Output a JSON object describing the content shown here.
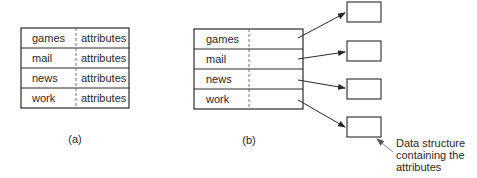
{
  "figure_a": {
    "label": "(a)",
    "rows": [
      {
        "name": "games",
        "value": "attributes"
      },
      {
        "name": "mail",
        "value": "attributes"
      },
      {
        "name": "news",
        "value": "attributes"
      },
      {
        "name": "work",
        "value": "attributes"
      }
    ]
  },
  "figure_b": {
    "label": "(b)",
    "rows": [
      {
        "name": "games"
      },
      {
        "name": "mail"
      },
      {
        "name": "news"
      },
      {
        "name": "work"
      }
    ],
    "callout": {
      "line1": "Data structure",
      "line2": "containing the",
      "line3": "attributes"
    }
  }
}
